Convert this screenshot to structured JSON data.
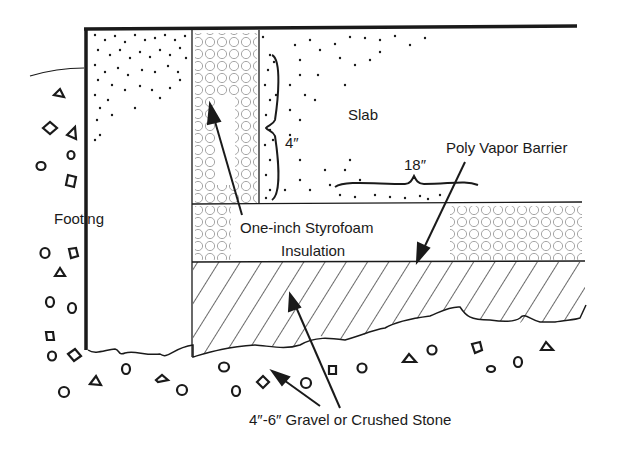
{
  "diagram": {
    "type": "cross-section",
    "labels": {
      "slab": "Slab",
      "slab_thickness": "4″",
      "insulation_width": "18″",
      "vapor_barrier": "Poly Vapor Barrier",
      "footing": "Footing",
      "insulation_line1": "One-inch Styrofoam",
      "insulation_line2": "Insulation",
      "gravel": "4″-6″ Gravel or Crushed Stone"
    },
    "layers": [
      {
        "name": "slab",
        "pattern": "stipple-dots"
      },
      {
        "name": "vertical-styrofoam",
        "pattern": "small-circles"
      },
      {
        "name": "horizontal-styrofoam",
        "pattern": "small-circles"
      },
      {
        "name": "gravel-base",
        "pattern": "diagonal-hatch"
      },
      {
        "name": "footing",
        "pattern": "stipple-dots"
      },
      {
        "name": "soil-stones",
        "pattern": "scattered-stones"
      }
    ],
    "colors": {
      "ink": "#1a1a1a",
      "paper": "#ffffff",
      "circle_ink": "#8a8a8a"
    }
  }
}
